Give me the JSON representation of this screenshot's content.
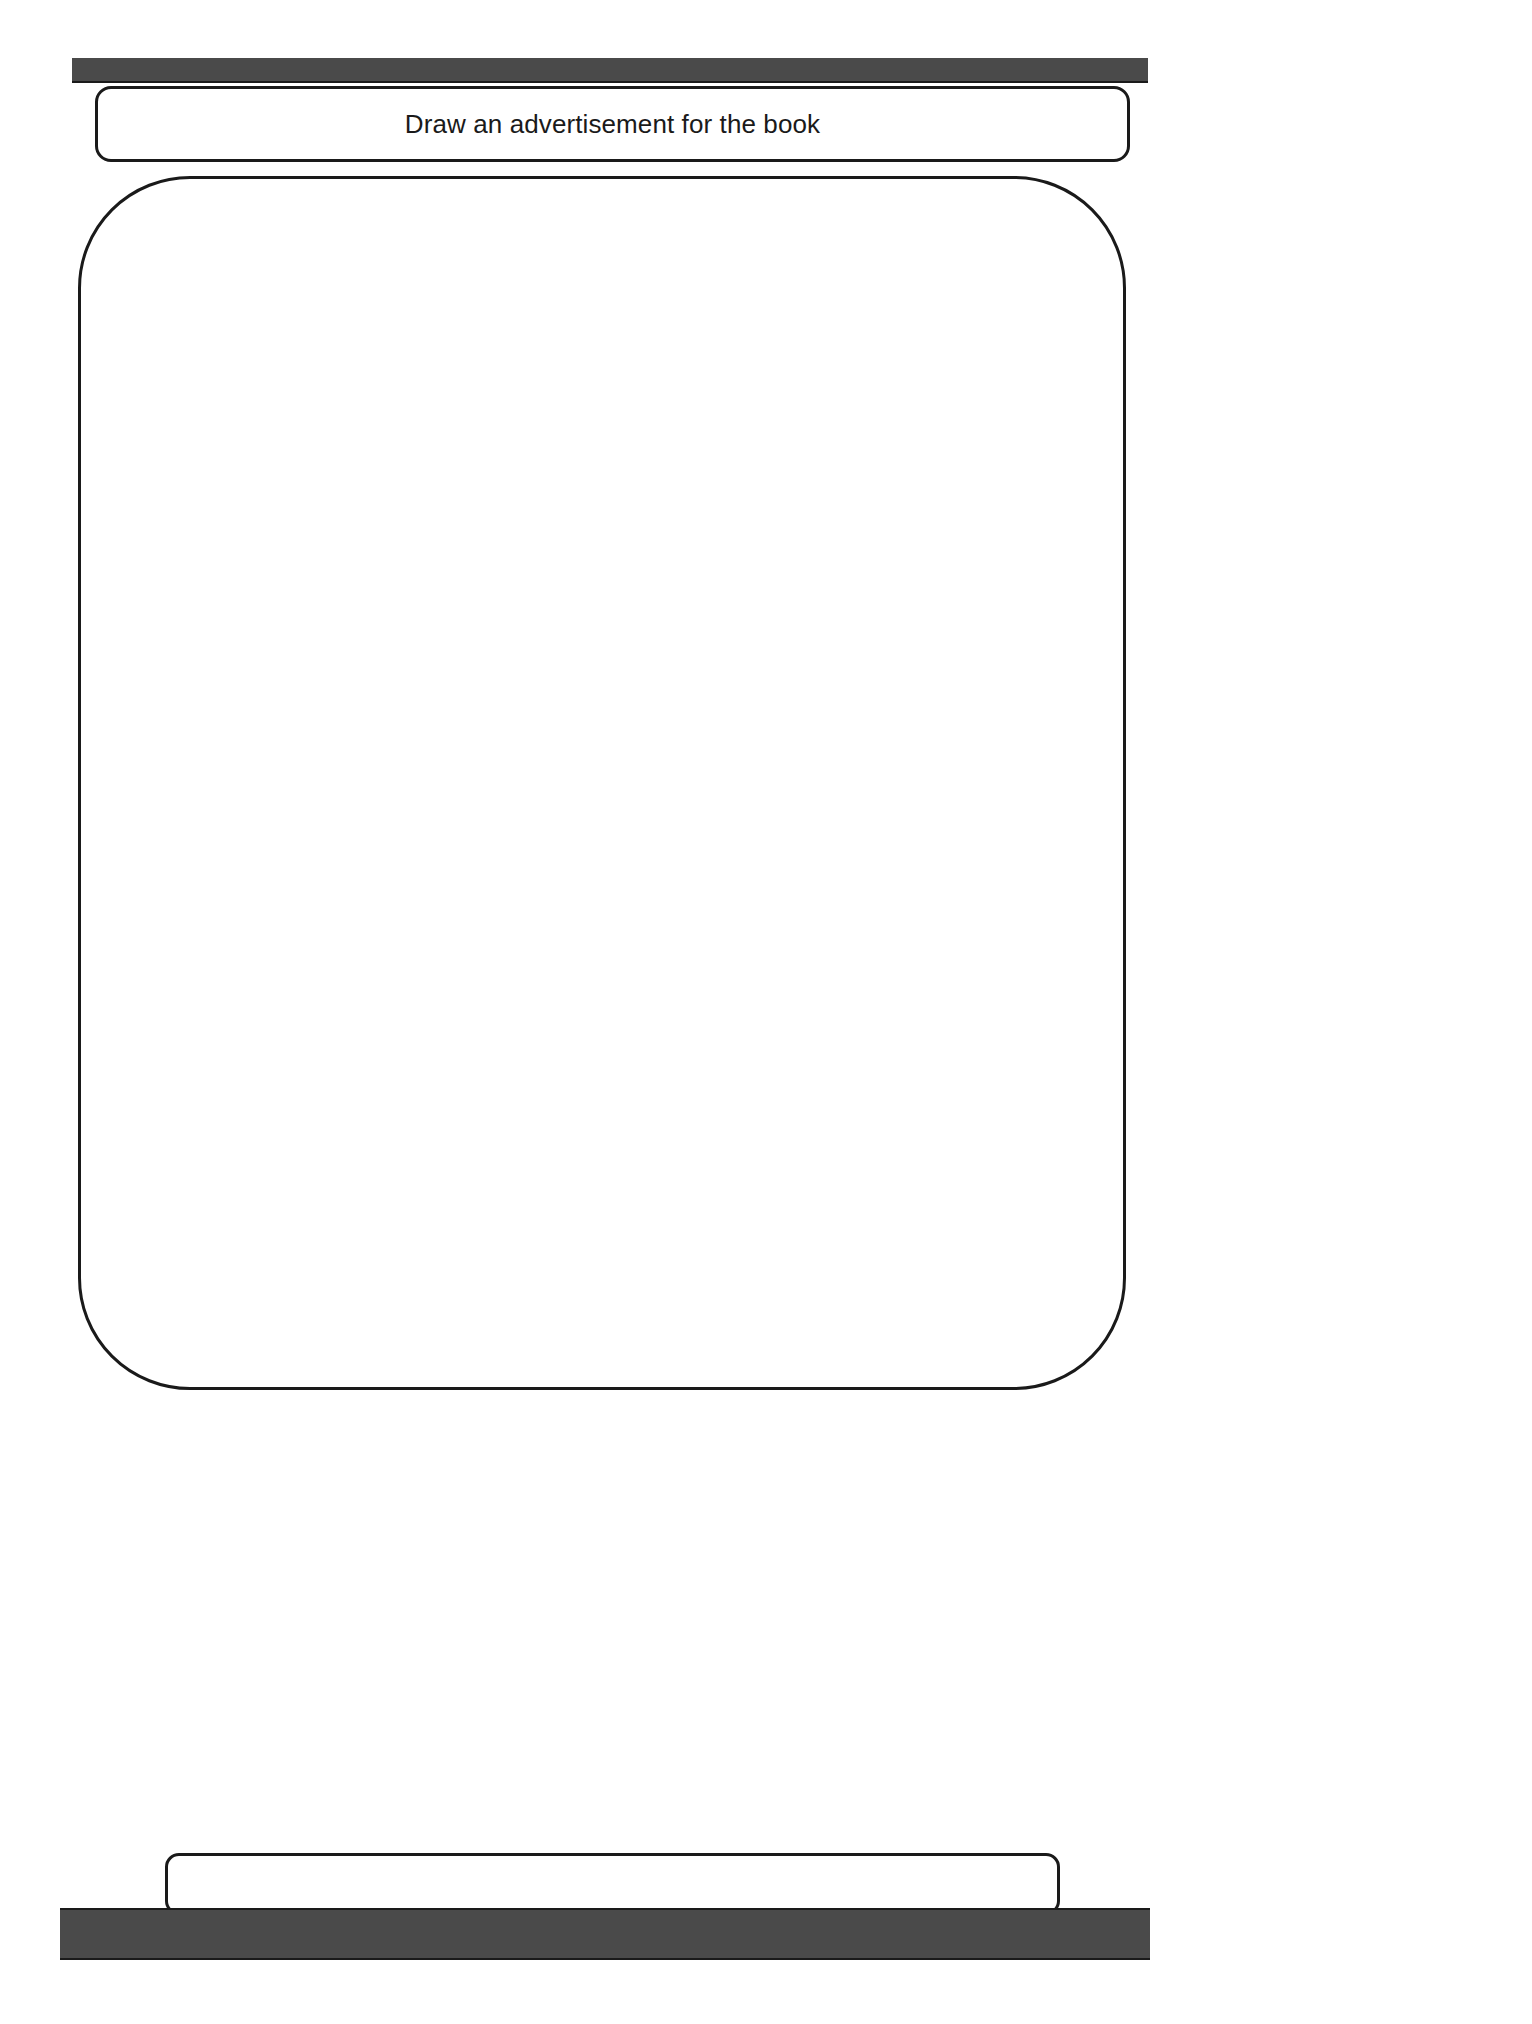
{
  "page": {
    "background_color": "#ffffff",
    "width": 1532,
    "height": 2024
  },
  "header": {
    "bar": {
      "name": "top-decorative-bar",
      "fill_color": "#4a4a4a",
      "border_color": "#1a1a1a"
    },
    "prompt_label": "Draw an advertisement for the book"
  },
  "main": {
    "drawing_area": {
      "label": "",
      "placeholder": "",
      "border_color": "#1a1a1a",
      "fill_color": "#ffffff"
    }
  },
  "footer": {
    "answer_field": {
      "value": "",
      "placeholder": "",
      "border_color": "#1a1a1a"
    },
    "bar": {
      "name": "bottom-decorative-bar",
      "fill_color": "#4a4a4a",
      "border_color": "#1a1a1a"
    }
  }
}
